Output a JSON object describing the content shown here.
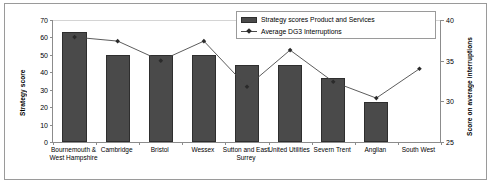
{
  "chart_data": {
    "type": "bar",
    "title": "",
    "subtitle": "",
    "xlabel": "",
    "ylabel": "Strategy score",
    "y2label": "Score on average interruptions",
    "ylim": [
      0,
      70
    ],
    "y2lim": [
      25,
      40
    ],
    "yticks": [
      0,
      10,
      20,
      30,
      40,
      50,
      60,
      70
    ],
    "y2ticks": [
      25,
      30,
      35,
      40
    ],
    "grid": true,
    "legend_position": "top-right",
    "categories": [
      "Bournemouth & West Hampshire",
      "Cambridge",
      "Bristol",
      "Wessex",
      "Sutton and East Surrey",
      "United Utilities",
      "Severn Trent",
      "Anglian",
      "South West"
    ],
    "series": [
      {
        "name": "Strategy scores Product and Services",
        "kind": "bar",
        "axis": "left",
        "color": "#4a4a4a",
        "values": [
          63,
          50,
          50,
          50,
          44,
          44,
          37,
          23,
          null
        ]
      },
      {
        "name": "Average DG3 Interruptions",
        "kind": "line",
        "axis": "right",
        "color": "#4a4a4a",
        "values": [
          37.9,
          37.4,
          35.0,
          37.4,
          31.8,
          36.3,
          32.4,
          30.4,
          34.0
        ]
      }
    ]
  },
  "legend": {
    "entries": [
      {
        "label": "Strategy scores Product and Services",
        "icon": "bar-swatch-icon"
      },
      {
        "label": "Average DG3 Interruptions",
        "icon": "line-marker-icon"
      }
    ]
  }
}
